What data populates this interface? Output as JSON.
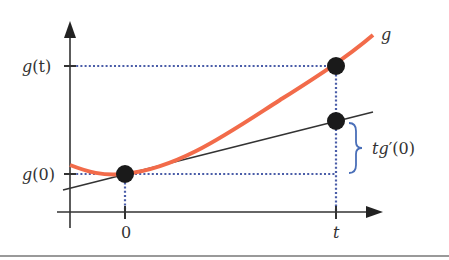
{
  "diagram": {
    "colors": {
      "curve": "#F26B4A",
      "tangent": "#333333",
      "dotted": "#4A5DA8",
      "brace": "#4A6FB8",
      "axis": "#333333",
      "point": "#1a1a1a",
      "rule": "#777777"
    },
    "labels": {
      "curve_name": "g",
      "y_tick_top_func": "g",
      "y_tick_top_arg": "(t)",
      "y_tick_bottom_func": "g",
      "y_tick_bottom_arg": "(0)",
      "x_tick_left": "0",
      "x_tick_right": "t",
      "brace_t": "t",
      "brace_g": "g",
      "brace_prime": "′",
      "brace_arg": "(0)"
    },
    "points": [
      {
        "name": "point-at-0",
        "x": 0,
        "value": "g(0)"
      },
      {
        "name": "point-g-at-t",
        "x": "t",
        "value": "g(t)"
      },
      {
        "name": "point-tangent-at-t",
        "x": "t",
        "value": "g(0) + t g'(0)"
      }
    ]
  }
}
